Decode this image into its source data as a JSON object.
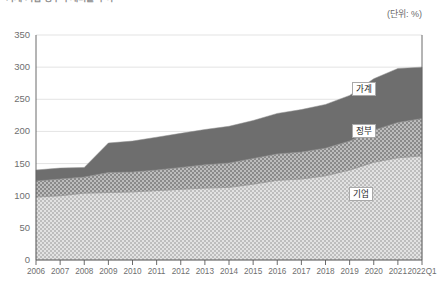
{
  "title": "가계·기업·정부 부채비율 추이",
  "unit_label": "(단위: %)",
  "chart_data": {
    "type": "area",
    "stacked": true,
    "title": "가계·기업·정부 부채비율 추이",
    "xlabel": "",
    "ylabel": "",
    "unit": "%",
    "ylim": [
      0,
      350
    ],
    "yticks": [
      0,
      50,
      100,
      150,
      200,
      250,
      300,
      350
    ],
    "grid": true,
    "legend_position": "inside-right",
    "categories": [
      "2006",
      "2007",
      "2008",
      "2009",
      "2010",
      "2011",
      "2012",
      "2013",
      "2014",
      "2015",
      "2016",
      "2017",
      "2018",
      "2019",
      "2020",
      "2021",
      "2022Q1"
    ],
    "series": [
      {
        "name": "기업",
        "color": "#c9c9c9",
        "pattern": "light-check",
        "values": [
          98,
          100,
          104,
          105,
          106,
          108,
          110,
          112,
          113,
          118,
          124,
          126,
          131,
          140,
          152,
          159,
          162
        ]
      },
      {
        "name": "정부",
        "color": "#9a9a9a",
        "pattern": "mid-check",
        "values": [
          25,
          26,
          25,
          31,
          31,
          32,
          34,
          36,
          38,
          40,
          41,
          42,
          43,
          45,
          50,
          55,
          58
        ]
      },
      {
        "name": "가계",
        "color": "#6e6e6e",
        "pattern": "solid",
        "values": [
          17,
          17,
          15,
          46,
          48,
          51,
          53,
          55,
          57,
          59,
          63,
          66,
          68,
          71,
          80,
          84,
          80
        ]
      }
    ],
    "totals": [
      140,
      143,
      144,
      182,
      185,
      191,
      197,
      203,
      208,
      217,
      228,
      234,
      242,
      256,
      282,
      298,
      300
    ]
  },
  "legend": [
    {
      "label": "가계"
    },
    {
      "label": "정부"
    },
    {
      "label": "기업"
    }
  ],
  "colors": {
    "background": "#ffffff",
    "grid": "#dcdcdc",
    "axis": "#5a5a5a",
    "text": "#6f6f6f",
    "series_corporate": "#c9c9c9",
    "series_government": "#9a9a9a",
    "series_household": "#6e6e6e"
  }
}
